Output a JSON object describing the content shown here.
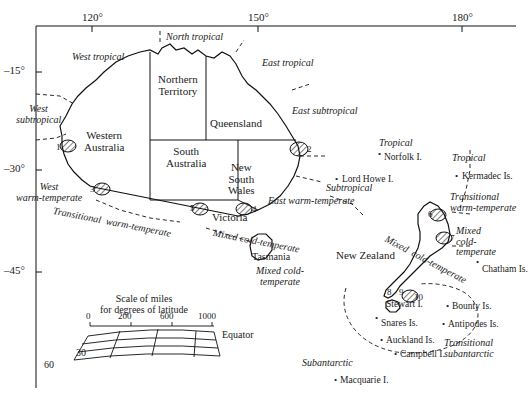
{
  "map": {
    "title": "Biogeographic zones of Australia and New Zealand",
    "axis": {
      "top_ticks": [
        {
          "label": "120°",
          "x": 82,
          "y": 17
        },
        {
          "label": "150°",
          "x": 248,
          "y": 17
        },
        {
          "label": "180°",
          "x": 452,
          "y": 17
        }
      ],
      "left_ticks": [
        {
          "label": "–15°",
          "x": 10,
          "y": 68
        },
        {
          "label": "–30°",
          "x": 10,
          "y": 166
        },
        {
          "label": "–45°",
          "x": 10,
          "y": 268
        }
      ]
    },
    "states": [
      {
        "name": "Western\nAustralia",
        "x": 96,
        "y": 136
      },
      {
        "name": "Northern\nTerritory",
        "x": 178,
        "y": 80
      },
      {
        "name": "Queensland",
        "x": 216,
        "y": 122
      },
      {
        "name": "South\nAustralia",
        "x": 180,
        "y": 148
      },
      {
        "name": "New\nSouth\nWales",
        "x": 240,
        "y": 168
      },
      {
        "name": "Victoria",
        "x": 222,
        "y": 216
      },
      {
        "name": "Tasmania",
        "x": 262,
        "y": 258
      },
      {
        "name": "New Zealand",
        "x": 358,
        "y": 255
      }
    ],
    "zones": [
      {
        "name": "West tropical",
        "x": 72,
        "y": 57
      },
      {
        "name": "North tropical",
        "x": 172,
        "y": 37
      },
      {
        "name": "East tropical",
        "x": 266,
        "y": 62
      },
      {
        "name": "West\nsubtropical",
        "x": 25,
        "y": 113
      },
      {
        "name": "East subtropical",
        "x": 296,
        "y": 110
      },
      {
        "name": "West\nwarm-temperate",
        "x": 32,
        "y": 188
      },
      {
        "name": "Transitional  warm-temperate",
        "x": 62,
        "y": 212
      },
      {
        "name": "East warm-temperate",
        "x": 272,
        "y": 200
      },
      {
        "name": "Subtropical",
        "x": 330,
        "y": 187
      },
      {
        "name": "Tropical",
        "x": 383,
        "y": 142
      },
      {
        "name": "Tropical",
        "x": 455,
        "y": 157
      },
      {
        "name": "Mixed cold-temperate",
        "x": 218,
        "y": 232
      },
      {
        "name": "Mixed cold-\ntemperate",
        "x": 262,
        "y": 270
      },
      {
        "name": "Mixed  cold-temperate",
        "x": 398,
        "y": 238
      },
      {
        "name": "Transitional\nwarm-temperate",
        "x": 455,
        "y": 198
      },
      {
        "name": "Mixed\ncold-\ntemperate",
        "x": 470,
        "y": 232
      },
      {
        "name": "Subantarctic",
        "x": 310,
        "y": 363
      },
      {
        "name": "Transitional\nsubantarctic",
        "x": 455,
        "y": 345
      }
    ],
    "islands": [
      {
        "name": "Norfolk I.",
        "x": 384,
        "y": 158,
        "dot_x": 381,
        "dot_y": 153
      },
      {
        "name": "Lord Howe I.",
        "x": 342,
        "y": 180,
        "dot_x": 338,
        "dot_y": 180
      },
      {
        "name": "Kermadec Is.",
        "x": 462,
        "y": 177,
        "dot_x": 458,
        "dot_y": 176
      },
      {
        "name": "Chatham Is.",
        "x": 482,
        "y": 270,
        "dot_x": 478,
        "dot_y": 262
      },
      {
        "name": "Stewart I.",
        "x": 386,
        "y": 305,
        "dot_x": 0,
        "dot_y": 0
      },
      {
        "name": "Bounty Is.",
        "x": 452,
        "y": 307,
        "dot_x": 448,
        "dot_y": 306
      },
      {
        "name": "Snares Is.",
        "x": 381,
        "y": 324,
        "dot_x": 378,
        "dot_y": 318
      },
      {
        "name": "Antipodes Is.",
        "x": 448,
        "y": 325,
        "dot_x": 444,
        "dot_y": 324
      },
      {
        "name": "Auckland Is.",
        "x": 386,
        "y": 341,
        "dot_x": 382,
        "dot_y": 340
      },
      {
        "name": "Campbell I.",
        "x": 400,
        "y": 355,
        "dot_x": 396,
        "dot_y": 354
      },
      {
        "name": "Macquarie I.",
        "x": 340,
        "y": 381,
        "dot_x": 336,
        "dot_y": 380
      }
    ],
    "site_markers": [
      {
        "id": "1",
        "x": 60,
        "y": 148
      },
      {
        "id": "2",
        "x": 307,
        "y": 150
      },
      {
        "id": "3",
        "x": 94,
        "y": 190
      },
      {
        "id": "4",
        "x": 252,
        "y": 210
      },
      {
        "id": "5",
        "x": 192,
        "y": 210
      },
      {
        "id": "6",
        "x": 430,
        "y": 217
      },
      {
        "id": "7",
        "x": 448,
        "y": 240
      },
      {
        "id": "8",
        "x": 390,
        "y": 292
      },
      {
        "id": "9",
        "x": 402,
        "y": 292
      },
      {
        "id": "10",
        "x": 416,
        "y": 297
      }
    ],
    "scale": {
      "title": "Scale of miles\nfor degrees of latitude",
      "title_x": 116,
      "title_y": 300,
      "unit_ticks": [
        "0",
        "200",
        "600",
        "1000"
      ],
      "lat_labels": [
        "60",
        "30"
      ],
      "equator_label": "Equator"
    }
  }
}
